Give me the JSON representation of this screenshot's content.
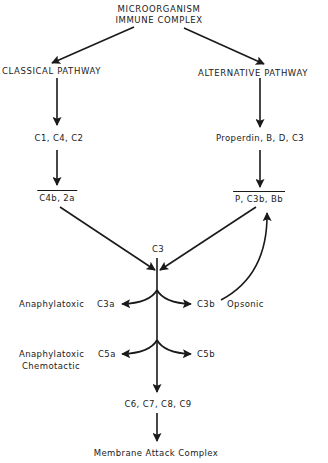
{
  "diagram": {
    "nodes": {
      "source_line1": "MICROORGANISM",
      "source_line2": "IMMUNE COMPLEX",
      "classical": "CLASSICAL PATHWAY",
      "alternative": "ALTERNATIVE PATHWAY",
      "classical_components": "C1, C4, C2",
      "alternative_components": "Properdin, B, D, C3",
      "classical_convertase": "C4b, 2a",
      "alternative_convertase": "P, C3b, Bb",
      "c3": "C3",
      "c3a_role": "Anaphylatoxic",
      "c3a": "C3a",
      "c3b": "C3b",
      "c3b_role": "Opsonic",
      "c5a_role_line1": "Anaphylatoxic",
      "c5a_role_line2": "Chemotactic",
      "c5a": "C5a",
      "c5b": "C5b",
      "terminal_components": "C6, C7, C8, C9",
      "final": "Membrane Attack Complex"
    },
    "edges": [
      {
        "from": "source",
        "to": "classical"
      },
      {
        "from": "source",
        "to": "alternative"
      },
      {
        "from": "classical",
        "to": "classical_components"
      },
      {
        "from": "alternative",
        "to": "alternative_components"
      },
      {
        "from": "classical_components",
        "to": "classical_convertase"
      },
      {
        "from": "alternative_components",
        "to": "alternative_convertase"
      },
      {
        "from": "classical_convertase",
        "to": "c3"
      },
      {
        "from": "alternative_convertase",
        "to": "c3"
      },
      {
        "from": "c3",
        "to": "c3a"
      },
      {
        "from": "c3",
        "to": "c3b"
      },
      {
        "from": "c3b",
        "to": "alternative_convertase",
        "type": "feedback"
      },
      {
        "from": "c3",
        "to": "c5a"
      },
      {
        "from": "c3",
        "to": "c5b"
      },
      {
        "from": "c3",
        "to": "terminal_components"
      },
      {
        "from": "terminal_components",
        "to": "final"
      }
    ],
    "colors": {
      "ink": "#1a1a1a",
      "background": "#ffffff"
    }
  }
}
